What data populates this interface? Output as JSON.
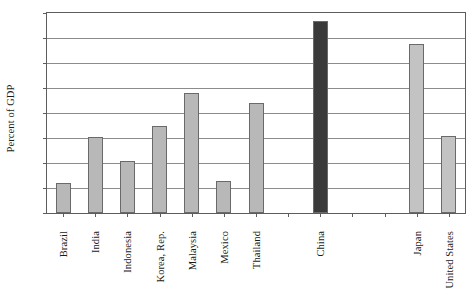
{
  "chart_data": {
    "type": "bar",
    "title": "",
    "xlabel": "",
    "ylabel": "Percent of GDP",
    "ylim": [
      0,
      160
    ],
    "yticks": [
      0,
      20,
      40,
      60,
      80,
      100,
      120,
      140,
      160
    ],
    "grid": true,
    "legend": false,
    "categories": [
      "Brazil",
      "India",
      "Indonesia",
      "Korea, Rep.",
      "Malaysia",
      "Mexico",
      "Thailand",
      "",
      "China",
      "",
      "",
      "Japan",
      "United States"
    ],
    "values": [
      24,
      61,
      42,
      70,
      96,
      26,
      88,
      null,
      154,
      null,
      null,
      135,
      62
    ],
    "bar_colors": [
      "#b8b8b8",
      "#b8b8b8",
      "#b8b8b8",
      "#b8b8b8",
      "#b8b8b8",
      "#b8b8b8",
      "#b8b8b8",
      null,
      "#3a3a3a",
      null,
      null,
      "#c3c3c3",
      "#c3c3c3"
    ],
    "series": [
      {
        "name": "Domestic credit to private sector",
        "values": [
          24,
          61,
          42,
          70,
          96,
          26,
          88,
          null,
          154,
          null,
          null,
          135,
          62
        ]
      }
    ],
    "annotations": []
  },
  "style": {
    "axis_color": "#5d5d5d",
    "grid_color": "#8c8c8c",
    "bar_border": "#6a6a6a",
    "background": "#ffffff",
    "text_color": "#1a1a1a"
  }
}
